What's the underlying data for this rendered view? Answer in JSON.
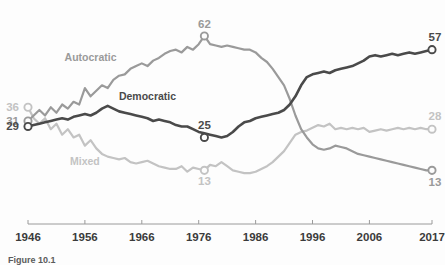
{
  "chart_data": {
    "type": "line",
    "title": "",
    "subtitle": "",
    "xlabel": "",
    "ylabel": "",
    "xlim": [
      1946,
      2017
    ],
    "ylim": [
      0,
      70
    ],
    "grid": false,
    "legend_position": "inline-labels",
    "x_ticks": [
      "1946",
      "1956",
      "1966",
      "1976",
      "1986",
      "1996",
      "2006",
      "2017"
    ],
    "x_tick_values": [
      1946,
      1956,
      1966,
      1976,
      1986,
      1996,
      2006,
      2017
    ],
    "series": [
      {
        "name": "Democratic",
        "color": "#4a4a4a",
        "label_x": 1967,
        "label_y": 38.5,
        "start_value": 29,
        "end_value": 57,
        "annotations": [
          {
            "text": "29",
            "year": 1946,
            "value": 29,
            "side": "left"
          },
          {
            "text": "25",
            "year": 1977,
            "value": 25,
            "side": "above"
          },
          {
            "text": "57",
            "year": 2017,
            "value": 57,
            "side": "above-right"
          }
        ],
        "markers": [
          {
            "year": 1946,
            "value": 29
          },
          {
            "year": 1977,
            "value": 25
          },
          {
            "year": 2017,
            "value": 57
          }
        ],
        "values": [
          29,
          29.5,
          30,
          30.5,
          31,
          31.5,
          32,
          31.5,
          32.5,
          33,
          33.5,
          33,
          34,
          35.5,
          36.5,
          35.5,
          34.5,
          34,
          33.5,
          33,
          32.5,
          32,
          31,
          31.5,
          31,
          30.5,
          29.5,
          29,
          29,
          28,
          27,
          26.5,
          26,
          25.5,
          25,
          25.5,
          27,
          29,
          30.5,
          31,
          32,
          32.5,
          33,
          33.5,
          34,
          35,
          37,
          40,
          44,
          47,
          48,
          48.5,
          49,
          48.5,
          49.5,
          50,
          50.5,
          51,
          52,
          53,
          54.5,
          55,
          54.5,
          55,
          55.5,
          55,
          55.5,
          56,
          55.5,
          56,
          56.5,
          57
        ]
      },
      {
        "name": "Autocratic",
        "color": "#9a9a9a",
        "label_x": 1957,
        "label_y": 53,
        "start_value": 31,
        "end_value": 13,
        "annotations": [
          {
            "text": "31",
            "year": 1946,
            "value": 31,
            "side": "left"
          },
          {
            "text": "62",
            "year": 1977,
            "value": 62,
            "side": "above"
          },
          {
            "text": "13",
            "year": 2017,
            "value": 13,
            "side": "below-right"
          }
        ],
        "markers": [
          {
            "year": 1946,
            "value": 31
          },
          {
            "year": 1977,
            "value": 62
          },
          {
            "year": 2017,
            "value": 13
          }
        ],
        "values": [
          31,
          33,
          35,
          33,
          36,
          34,
          37,
          35.5,
          38,
          37,
          43,
          40,
          42,
          44,
          43,
          46,
          47.5,
          48,
          50,
          51,
          52,
          51,
          53,
          54,
          55.5,
          56.5,
          57,
          56,
          58,
          57,
          59,
          62,
          59,
          58.5,
          58,
          58.5,
          58,
          57.5,
          57,
          57,
          56,
          54,
          52.5,
          50,
          47,
          44,
          39,
          33,
          28,
          25,
          22.5,
          21,
          20.5,
          21,
          22,
          21.5,
          21,
          20,
          19,
          18.5,
          18,
          17.5,
          17,
          16.5,
          16,
          15.5,
          15,
          14.5,
          14,
          13.5,
          13,
          13
        ]
      },
      {
        "name": "Mixed",
        "color": "#c3c3c3",
        "label_x": 1956,
        "label_y": 15,
        "start_value": 36,
        "end_value": 28,
        "annotations": [
          {
            "text": "36",
            "year": 1946,
            "value": 36,
            "side": "left"
          },
          {
            "text": "13",
            "year": 1977,
            "value": 13,
            "side": "below"
          },
          {
            "text": "28",
            "year": 2017,
            "value": 28,
            "side": "above-right"
          }
        ],
        "markers": [
          {
            "year": 1946,
            "value": 36
          },
          {
            "year": 1977,
            "value": 13
          },
          {
            "year": 2017,
            "value": 28
          }
        ],
        "values": [
          36,
          32,
          30,
          32,
          28,
          30,
          26,
          28,
          25,
          26,
          22,
          24,
          21,
          19,
          18,
          17.5,
          17,
          17.5,
          16,
          15.5,
          16,
          16.5,
          15.5,
          14.5,
          14,
          13.5,
          13.5,
          14.5,
          12.5,
          14,
          13.5,
          13,
          15,
          14.5,
          16,
          14.5,
          13,
          12.5,
          12,
          12,
          12.5,
          13.5,
          14.5,
          16,
          18,
          20,
          23,
          26,
          27,
          27.5,
          28.5,
          29.5,
          29,
          30,
          28,
          28.5,
          28,
          28.5,
          28,
          28.5,
          27,
          27.5,
          28,
          27.5,
          28,
          28.5,
          28,
          28.5,
          28,
          28.5,
          28,
          28
        ]
      }
    ]
  },
  "caption": {
    "text": "Figure 10.1"
  }
}
